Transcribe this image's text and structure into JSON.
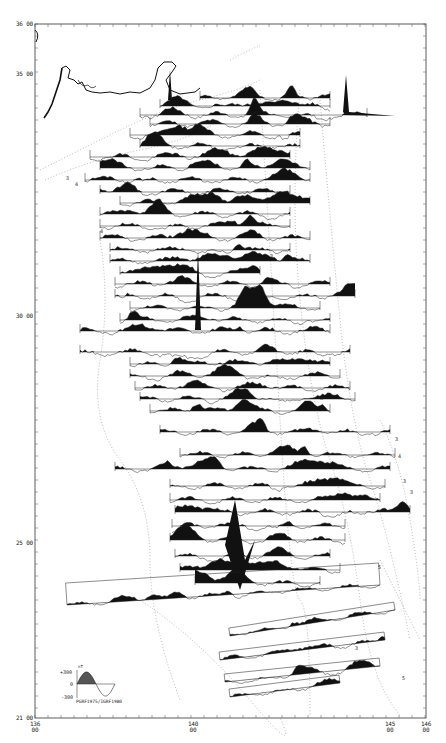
{
  "figure": {
    "type": "magnetic anomaly profiles along ship tracks",
    "frame": {
      "left": 35,
      "top": 24,
      "right": 426,
      "bottom": 718
    }
  },
  "axes": {
    "latitude_labels": [
      {
        "deg": "36",
        "min": "00",
        "y": 24
      },
      {
        "deg": "35",
        "min": "00",
        "y": 74
      },
      {
        "deg": "30",
        "min": "00",
        "y": 316
      },
      {
        "deg": "25",
        "min": "00",
        "y": 543
      },
      {
        "deg": "21",
        "min": "00",
        "y": 718
      }
    ],
    "longitude_labels": [
      {
        "deg": "136",
        "min": "00",
        "x": 35
      },
      {
        "deg": "140",
        "min": "00",
        "x": 193
      },
      {
        "deg": "145",
        "min": "00",
        "x": 390
      },
      {
        "deg": "146",
        "min": "00",
        "x": 426
      }
    ]
  },
  "legend": {
    "plus_label": "+300",
    "zero_label": "0",
    "minus_label": "-300",
    "unit": "nT",
    "caption": "PGRF1975/IGRF1980",
    "fill_color": "#555555"
  },
  "contour_labels": [
    {
      "text": "3",
      "x": 66,
      "y": 175
    },
    {
      "text": "4",
      "x": 75,
      "y": 181
    },
    {
      "text": "3",
      "x": 395,
      "y": 436
    },
    {
      "text": "4",
      "x": 398,
      "y": 453
    },
    {
      "text": "3",
      "x": 403,
      "y": 478
    },
    {
      "text": "3",
      "x": 410,
      "y": 489
    },
    {
      "text": "5",
      "x": 378,
      "y": 564
    },
    {
      "text": "5",
      "x": 402,
      "y": 675
    },
    {
      "text": "3",
      "x": 355,
      "y": 645
    },
    {
      "text": "4",
      "x": 100,
      "y": 228
    },
    {
      "text": "3",
      "x": 270,
      "y": 253
    },
    {
      "text": "3",
      "x": 320,
      "y": 395
    }
  ],
  "tracks": [
    {
      "y": 98,
      "x1": 200,
      "x2": 330,
      "seed": 3,
      "amp": 9
    },
    {
      "y": 106,
      "x1": 160,
      "x2": 330,
      "seed": 5,
      "amp": 10
    },
    {
      "y": 115,
      "x1": 140,
      "x2": 367,
      "seed": 7,
      "amp": 12
    },
    {
      "y": 124,
      "x1": 150,
      "x2": 330,
      "seed": 11,
      "amp": 11
    },
    {
      "y": 135,
      "x1": 130,
      "x2": 300,
      "seed": 13,
      "amp": 12
    },
    {
      "y": 146,
      "x1": 140,
      "x2": 300,
      "seed": 17,
      "amp": 12
    },
    {
      "y": 157,
      "x1": 90,
      "x2": 290,
      "seed": 19,
      "amp": 11
    },
    {
      "y": 168,
      "x1": 100,
      "x2": 310,
      "seed": 23,
      "amp": 10
    },
    {
      "y": 180,
      "x1": 85,
      "x2": 310,
      "seed": 29,
      "amp": 10
    },
    {
      "y": 192,
      "x1": 100,
      "x2": 290,
      "seed": 31,
      "amp": 11
    },
    {
      "y": 203,
      "x1": 120,
      "x2": 310,
      "seed": 37,
      "amp": 10
    },
    {
      "y": 214,
      "x1": 100,
      "x2": 290,
      "seed": 41,
      "amp": 10
    },
    {
      "y": 226,
      "x1": 100,
      "x2": 290,
      "seed": 43,
      "amp": 10
    },
    {
      "y": 238,
      "x1": 100,
      "x2": 310,
      "seed": 47,
      "amp": 11
    },
    {
      "y": 250,
      "x1": 110,
      "x2": 290,
      "seed": 53,
      "amp": 10
    },
    {
      "y": 261,
      "x1": 110,
      "x2": 310,
      "seed": 59,
      "amp": 10
    },
    {
      "y": 273,
      "x1": 120,
      "x2": 260,
      "seed": 61,
      "amp": 10
    },
    {
      "y": 284,
      "x1": 115,
      "x2": 330,
      "seed": 67,
      "amp": 11
    },
    {
      "y": 296,
      "x1": 115,
      "x2": 355,
      "seed": 71,
      "amp": 11
    },
    {
      "y": 308,
      "x1": 130,
      "x2": 320,
      "seed": 73,
      "amp": 10
    },
    {
      "y": 320,
      "x1": 120,
      "x2": 330,
      "seed": 79,
      "amp": 10
    },
    {
      "y": 331,
      "x1": 80,
      "x2": 330,
      "seed": 83,
      "amp": 11
    },
    {
      "y": 352,
      "x1": 80,
      "x2": 350,
      "seed": 89,
      "amp": 11
    },
    {
      "y": 364,
      "x1": 130,
      "x2": 330,
      "seed": 97,
      "amp": 10
    },
    {
      "y": 376,
      "x1": 130,
      "x2": 340,
      "seed": 101,
      "amp": 10
    },
    {
      "y": 388,
      "x1": 135,
      "x2": 350,
      "seed": 103,
      "amp": 10
    },
    {
      "y": 399,
      "x1": 140,
      "x2": 355,
      "seed": 107,
      "amp": 10
    },
    {
      "y": 411,
      "x1": 150,
      "x2": 330,
      "seed": 109,
      "amp": 10
    },
    {
      "y": 432,
      "x1": 160,
      "x2": 390,
      "seed": 113,
      "amp": 10
    },
    {
      "y": 455,
      "x1": 180,
      "x2": 395,
      "seed": 127,
      "amp": 10
    },
    {
      "y": 469,
      "x1": 115,
      "x2": 390,
      "seed": 131,
      "amp": 10
    },
    {
      "y": 486,
      "x1": 170,
      "x2": 385,
      "seed": 137,
      "amp": 10
    },
    {
      "y": 500,
      "x1": 170,
      "x2": 380,
      "seed": 139,
      "amp": 10
    },
    {
      "y": 512,
      "x1": 175,
      "x2": 410,
      "seed": 149,
      "amp": 11
    },
    {
      "y": 526,
      "x1": 172,
      "x2": 345,
      "seed": 151,
      "amp": 10
    },
    {
      "y": 540,
      "x1": 170,
      "x2": 345,
      "seed": 157,
      "amp": 10
    },
    {
      "y": 556,
      "x1": 175,
      "x2": 330,
      "seed": 163,
      "amp": 10
    },
    {
      "y": 570,
      "x1": 180,
      "x2": 340,
      "seed": 167,
      "amp": 10
    },
    {
      "y": 583,
      "x1": 195,
      "x2": 320,
      "seed": 173,
      "amp": 10
    }
  ],
  "oblique_tracks": [
    {
      "x1": 67,
      "y1": 605,
      "x2": 380,
      "y2": 585,
      "seed": 181,
      "amp": 8,
      "width": 22
    },
    {
      "x1": 230,
      "y1": 636,
      "x2": 395,
      "y2": 610,
      "seed": 191,
      "amp": 8,
      "width": 8
    },
    {
      "x1": 220,
      "y1": 660,
      "x2": 385,
      "y2": 640,
      "seed": 193,
      "amp": 8,
      "width": 8
    },
    {
      "x1": 225,
      "y1": 682,
      "x2": 380,
      "y2": 666,
      "seed": 197,
      "amp": 8,
      "width": 8
    },
    {
      "x1": 230,
      "y1": 697,
      "x2": 340,
      "y2": 683,
      "seed": 199,
      "amp": 8,
      "width": 8
    }
  ]
}
